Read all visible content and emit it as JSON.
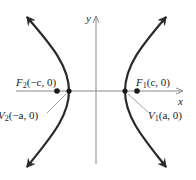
{
  "diagram": {
    "type": "hyperbola",
    "axes": {
      "x_label": "x",
      "y_label": "y"
    },
    "points": [
      {
        "name": "F1",
        "label_main": "F",
        "label_sub": "1",
        "label_args": "(c, 0)",
        "role": "focus",
        "x": 137,
        "y": 91
      },
      {
        "name": "F2",
        "label_main": "F",
        "label_sub": "2",
        "label_args": "(−c, 0)",
        "role": "focus",
        "x": 57,
        "y": 91
      },
      {
        "name": "V1",
        "label_main": "V",
        "label_sub": "1",
        "label_args": "(a, 0)",
        "role": "vertex",
        "x": 125,
        "y": 91
      },
      {
        "name": "V2",
        "label_main": "V",
        "label_sub": "2",
        "label_args": "(−a, 0)",
        "role": "vertex",
        "x": 69,
        "y": 91
      }
    ],
    "colors": {
      "curve": "#2a2a2a",
      "axis": "#8a8a8a",
      "text": "#222222"
    }
  }
}
